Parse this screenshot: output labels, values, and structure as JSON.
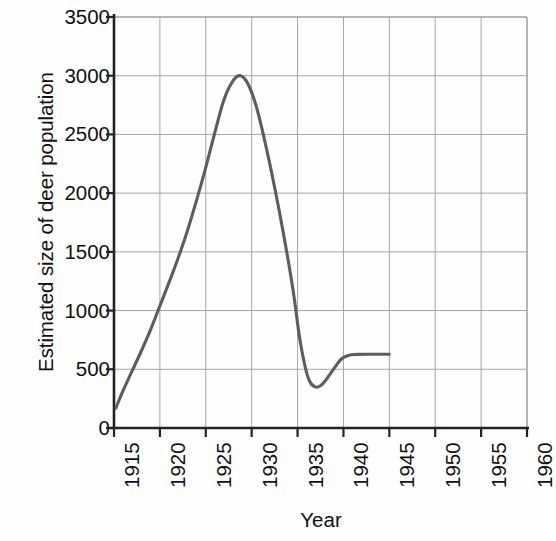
{
  "chart_data": {
    "type": "line",
    "title": "",
    "xlabel": "Year",
    "ylabel": "Estimated size of deer population",
    "xlim": [
      1915,
      1960
    ],
    "ylim": [
      0,
      3500
    ],
    "grid": true,
    "legend": false,
    "legend_position": "none",
    "xticks": [
      "1915",
      "1920",
      "1925",
      "1930",
      "1935",
      "1940",
      "1945",
      "1950",
      "1955",
      "1960"
    ],
    "yticks": [
      "0",
      "500",
      "1000",
      "1500",
      "2000",
      "2500",
      "3000",
      "3500"
    ],
    "series": [
      {
        "name": "Estimated size of deer population",
        "color": "#5d5d5d",
        "x": [
          1915.2,
          1916,
          1917,
          1918,
          1919,
          1920,
          1921,
          1922,
          1923,
          1924,
          1925,
          1926,
          1927,
          1928,
          1928.8,
          1929.6,
          1930.5,
          1931.5,
          1932.5,
          1933.5,
          1934.5,
          1935.2,
          1935.8,
          1936.3,
          1936.9,
          1937.5,
          1938.2,
          1939,
          1939.8,
          1940.6,
          1941.5,
          1943,
          1945
        ],
        "y": [
          170,
          320,
          490,
          660,
          840,
          1040,
          1240,
          1450,
          1680,
          1940,
          2220,
          2520,
          2800,
          2960,
          3000,
          2930,
          2740,
          2420,
          2050,
          1640,
          1180,
          780,
          530,
          400,
          350,
          360,
          420,
          510,
          590,
          620,
          627,
          628,
          628
        ]
      }
    ],
    "annotations": []
  }
}
